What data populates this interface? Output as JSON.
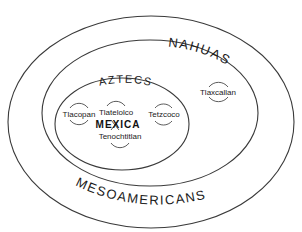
{
  "diagram": {
    "type": "nested-ellipses",
    "groups": [
      {
        "label": "MESOAMERICANS",
        "level": "outer"
      },
      {
        "label": "NAHUAS",
        "level": "middle"
      },
      {
        "label": "AZTECS",
        "level": "inner"
      }
    ],
    "cities": [
      {
        "name": "Tlacopan",
        "group": "AZTECS"
      },
      {
        "name": "Tlatelolco",
        "group": "AZTECS"
      },
      {
        "name": "Tenochtitlan",
        "group": "AZTECS"
      },
      {
        "name": "Tetzcoco",
        "group": "AZTECS"
      },
      {
        "name": "Tlaxcallan",
        "group": "NAHUAS"
      }
    ],
    "capital": "MEXICA",
    "stroke_color": "#3a3a3a",
    "background": "#ffffff"
  }
}
